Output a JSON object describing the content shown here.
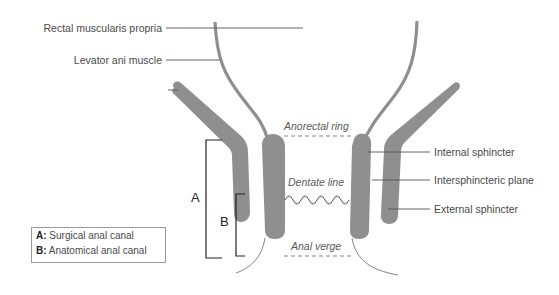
{
  "labels": {
    "rectal_muscularis": "Rectal muscularis propria",
    "levator_ani": "Levator ani muscle",
    "anorectal_ring": "Anorectal ring",
    "dentate_line": "Dentate line",
    "anal_verge": "Anal verge",
    "internal_sphincter": "Internal sphincter",
    "intersphincteric_plane": "Intersphincteric plane",
    "external_sphincter": "External sphincter",
    "bracket_a": "A",
    "bracket_b": "B"
  },
  "legend": {
    "items": [
      {
        "key": "A:",
        "text": " Surgical anal canal"
      },
      {
        "key": "B:",
        "text": " Anatomical anal canal"
      }
    ]
  },
  "colors": {
    "muscle": "#8f8f8f",
    "line": "#555555",
    "text": "#4a4a4a"
  }
}
